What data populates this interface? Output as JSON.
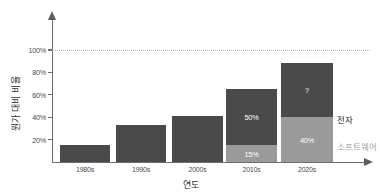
{
  "chart_data": {
    "type": "bar",
    "subtype": "stacked",
    "title": "",
    "xlabel": "연도",
    "ylabel": "원가 대비 비율",
    "categories": [
      "1980s",
      "1990s",
      "2000s",
      "2010s",
      "2020s"
    ],
    "ylim": [
      0,
      110
    ],
    "yticks": [
      20,
      40,
      60,
      80,
      100
    ],
    "ytick_labels": [
      "20%",
      "40%",
      "60%",
      "80%",
      "100%"
    ],
    "grid": false,
    "legend_position": "right-inline",
    "reference_line": {
      "value": 100,
      "style": "dotted",
      "label": "100%"
    },
    "series": [
      {
        "name": "소프트웨어",
        "color": "#9a9a9a",
        "values": [
          0,
          0,
          0,
          15,
          40
        ],
        "labels": [
          "",
          "",
          "",
          "15%",
          "40%"
        ]
      },
      {
        "name": "전자",
        "color": "#4a4a4a",
        "values": [
          15,
          33,
          41,
          50,
          48
        ],
        "labels": [
          "",
          "",
          "",
          "50%",
          "?"
        ]
      }
    ],
    "totals": [
      15,
      33,
      41,
      65,
      88
    ],
    "annotations": [
      {
        "text": "50%",
        "category": "2010s",
        "series": "전자"
      },
      {
        "text": "15%",
        "category": "2010s",
        "series": "소프트웨어"
      },
      {
        "text": "?",
        "category": "2020s",
        "series": "전자"
      },
      {
        "text": "40%",
        "category": "2020s",
        "series": "소프트웨어"
      }
    ]
  },
  "legend": {
    "electronics": "전자",
    "software": "소프트웨어"
  },
  "axes": {
    "x_title": "연도",
    "y_title": "원가 대비 비율"
  },
  "colors": {
    "electronics": "#4a4a4a",
    "software": "#9a9a9a",
    "axis": "#6f6f6f",
    "reference_line": "#b4b4b4",
    "background": "#ffffff"
  }
}
